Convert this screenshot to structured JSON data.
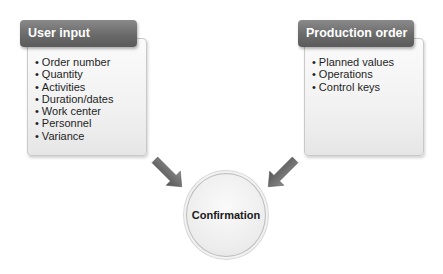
{
  "left_panel": {
    "title": "User input",
    "items": [
      "Order number",
      "Quantity",
      "Activities",
      "Duration/dates",
      "Work center",
      "Personnel",
      "Variance"
    ]
  },
  "right_panel": {
    "title": "Production order",
    "items": [
      "Planned values",
      "Operations",
      "Control keys"
    ]
  },
  "center": {
    "label": "Confirmation"
  },
  "arrows": [
    {
      "from": "left_panel",
      "to": "center",
      "icon": "arrow-down-right-icon"
    },
    {
      "from": "right_panel",
      "to": "center",
      "icon": "arrow-down-left-icon"
    }
  ],
  "colors": {
    "header": "#6a6a6a",
    "arrow": "#6e6e6e",
    "text": "#1e1e1e"
  }
}
